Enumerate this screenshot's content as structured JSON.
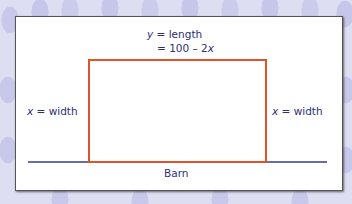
{
  "diagram": {
    "type": "fenced-rectangle-against-barn",
    "top_label": {
      "line1_var": "y",
      "line1_rest": " = length",
      "line2_prefix": "= 100 – 2",
      "line2_var": "x"
    },
    "left_label": {
      "var": "x",
      "rest": " = width"
    },
    "right_label": {
      "var": "x",
      "rest": " = width"
    },
    "bottom_label": "Barn",
    "colors": {
      "fence": "#e0522a",
      "barn_line": "#3a3a8c",
      "text": "#2e2e7a",
      "panel": "#ffffff",
      "background": "#dedef2"
    }
  }
}
